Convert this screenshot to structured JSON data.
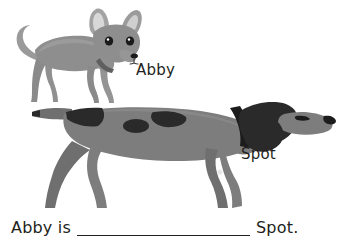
{
  "worksheet": {
    "background_color": "#ffffff",
    "text_color": "#231f20"
  },
  "figures": {
    "small_dog": {
      "name": "Abby",
      "caption": "Abby",
      "breed_look": "chihuahua",
      "facing": "right",
      "body_color": "#8e8e8e",
      "shade_color": "#7a7a7a",
      "ear_inner_color": "#d8d8d8",
      "dark_color": "#2a2a2a",
      "collar_color": "#5a5a5a"
    },
    "large_dog": {
      "name": "Spot",
      "caption": "Spot",
      "breed_look": "pointer",
      "facing": "right",
      "body_color": "#7d7d7d",
      "shade_color": "#6f6f6f",
      "patch_color": "#2a2a2a",
      "collar_color": "#1c1c1c",
      "nose_color": "#1c1c1c"
    }
  },
  "sentence": {
    "prefix": "Abby is",
    "blank_placeholder": "",
    "suffix": "Spot."
  }
}
